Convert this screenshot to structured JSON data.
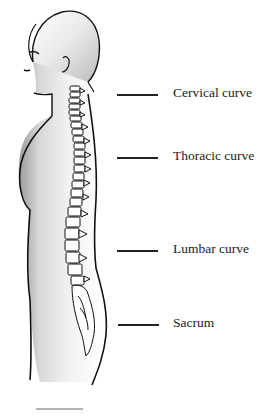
{
  "diagram": {
    "labels": [
      {
        "id": "cervical",
        "text": "Cervical curve",
        "y": 95
      },
      {
        "id": "thoracic",
        "text": "Thoracic curve",
        "y": 158
      },
      {
        "id": "lumbar",
        "text": "Lumbar curve",
        "y": 251
      },
      {
        "id": "sacrum",
        "text": "Sacrum",
        "y": 325
      }
    ]
  }
}
